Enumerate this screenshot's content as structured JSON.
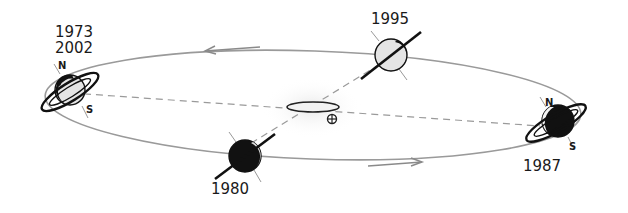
{
  "diagram": {
    "positions": [
      {
        "id": "left",
        "years": [
          "1973",
          "2002"
        ],
        "north": "N",
        "south": "S"
      },
      {
        "id": "top",
        "years": [
          "1995"
        ]
      },
      {
        "id": "right",
        "years": [
          "1987"
        ],
        "north": "N",
        "south": "S"
      },
      {
        "id": "bottom",
        "years": [
          "1980"
        ]
      }
    ],
    "earth_symbol": "⊕",
    "colors": {
      "orbit": "#9a9a9a",
      "ink": "#111111",
      "planet_light": "#e6e6e6",
      "background": "#ffffff"
    }
  }
}
